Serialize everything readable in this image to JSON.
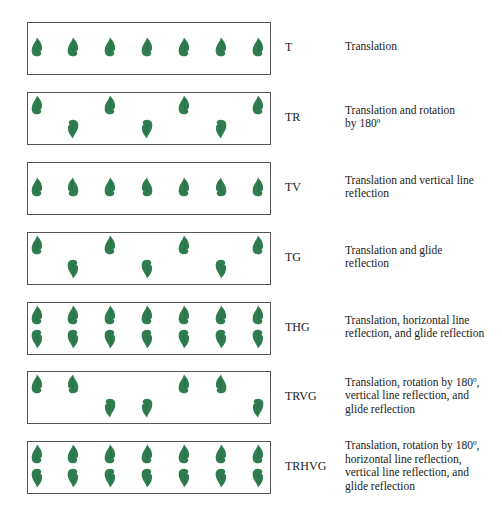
{
  "colors": {
    "leaf": "#2f7d4f",
    "leaf_dark": "#1f5f3a",
    "border": "#555555"
  },
  "leaf_x": [
    37,
    73,
    110,
    147,
    184,
    221,
    258
  ],
  "patterns": [
    {
      "code": "T",
      "description": [
        "Translation"
      ],
      "top": 22,
      "leaves": [
        {
          "col": 0,
          "row": "mid",
          "orient": "up"
        },
        {
          "col": 1,
          "row": "mid",
          "orient": "up"
        },
        {
          "col": 2,
          "row": "mid",
          "orient": "up"
        },
        {
          "col": 3,
          "row": "mid",
          "orient": "up"
        },
        {
          "col": 4,
          "row": "mid",
          "orient": "up"
        },
        {
          "col": 5,
          "row": "mid",
          "orient": "up"
        },
        {
          "col": 6,
          "row": "mid",
          "orient": "up"
        }
      ]
    },
    {
      "code": "TR",
      "description": [
        "Translation and rotation",
        "by 180º"
      ],
      "top": 92,
      "leaves": [
        {
          "col": 0,
          "row": "top",
          "orient": "up"
        },
        {
          "col": 1,
          "row": "bottom",
          "orient": "rot180"
        },
        {
          "col": 2,
          "row": "top",
          "orient": "up"
        },
        {
          "col": 3,
          "row": "bottom",
          "orient": "rot180"
        },
        {
          "col": 4,
          "row": "top",
          "orient": "up"
        },
        {
          "col": 5,
          "row": "bottom",
          "orient": "rot180"
        },
        {
          "col": 6,
          "row": "top",
          "orient": "up"
        }
      ]
    },
    {
      "code": "TV",
      "description": [
        "Translation and vertical line",
        "reflection"
      ],
      "top": 162,
      "leaves": [
        {
          "col": 0,
          "row": "mid",
          "orient": "up"
        },
        {
          "col": 1,
          "row": "mid",
          "orient": "mirror"
        },
        {
          "col": 2,
          "row": "mid",
          "orient": "up"
        },
        {
          "col": 3,
          "row": "mid",
          "orient": "mirror"
        },
        {
          "col": 4,
          "row": "mid",
          "orient": "up"
        },
        {
          "col": 5,
          "row": "mid",
          "orient": "mirror"
        },
        {
          "col": 6,
          "row": "mid",
          "orient": "up"
        }
      ]
    },
    {
      "code": "TG",
      "description": [
        "Translation and glide",
        "reflection"
      ],
      "top": 232,
      "leaves": [
        {
          "col": 0,
          "row": "top",
          "orient": "up"
        },
        {
          "col": 1,
          "row": "bottom",
          "orient": "flipv"
        },
        {
          "col": 2,
          "row": "top",
          "orient": "up"
        },
        {
          "col": 3,
          "row": "bottom",
          "orient": "flipv"
        },
        {
          "col": 4,
          "row": "top",
          "orient": "up"
        },
        {
          "col": 5,
          "row": "bottom",
          "orient": "flipv"
        },
        {
          "col": 6,
          "row": "top",
          "orient": "up"
        }
      ]
    },
    {
      "code": "THG",
      "description": [
        "Translation, horizontal line",
        "reflection, and glide reflection"
      ],
      "top": 302,
      "leaves": [
        {
          "col": 0,
          "row": "top",
          "orient": "up"
        },
        {
          "col": 0,
          "row": "bottom",
          "orient": "flipv"
        },
        {
          "col": 1,
          "row": "top",
          "orient": "up"
        },
        {
          "col": 1,
          "row": "bottom",
          "orient": "flipv"
        },
        {
          "col": 2,
          "row": "top",
          "orient": "up"
        },
        {
          "col": 2,
          "row": "bottom",
          "orient": "flipv"
        },
        {
          "col": 3,
          "row": "top",
          "orient": "up"
        },
        {
          "col": 3,
          "row": "bottom",
          "orient": "flipv"
        },
        {
          "col": 4,
          "row": "top",
          "orient": "up"
        },
        {
          "col": 4,
          "row": "bottom",
          "orient": "flipv"
        },
        {
          "col": 5,
          "row": "top",
          "orient": "up"
        },
        {
          "col": 5,
          "row": "bottom",
          "orient": "flipv"
        },
        {
          "col": 6,
          "row": "top",
          "orient": "up"
        },
        {
          "col": 6,
          "row": "bottom",
          "orient": "flipv"
        }
      ]
    },
    {
      "code": "TRVG",
      "description": [
        "Translation, rotation by 180º,",
        "vertical line reflection, and",
        "glide reflection"
      ],
      "top": 371,
      "leaves": [
        {
          "col": 0,
          "row": "top",
          "orient": "up"
        },
        {
          "col": 1,
          "row": "top",
          "orient": "mirror"
        },
        {
          "col": 2,
          "row": "bottom",
          "orient": "rot180"
        },
        {
          "col": 3,
          "row": "bottom",
          "orient": "flipv_mirror"
        },
        {
          "col": 4,
          "row": "top",
          "orient": "up"
        },
        {
          "col": 5,
          "row": "top",
          "orient": "mirror"
        },
        {
          "col": 6,
          "row": "bottom",
          "orient": "rot180"
        }
      ]
    },
    {
      "code": "TRHVG",
      "description": [
        "Translation, rotation by 180º,",
        "horizontal line reflection,",
        "vertical line reflection, and",
        "glide reflection"
      ],
      "top": 441,
      "leaves": [
        {
          "col": 0,
          "row": "top",
          "orient": "up"
        },
        {
          "col": 0,
          "row": "bottom",
          "orient": "flipv"
        },
        {
          "col": 1,
          "row": "top",
          "orient": "up"
        },
        {
          "col": 1,
          "row": "bottom",
          "orient": "flipv"
        },
        {
          "col": 2,
          "row": "top",
          "orient": "up"
        },
        {
          "col": 2,
          "row": "bottom",
          "orient": "flipv"
        },
        {
          "col": 3,
          "row": "top",
          "orient": "up"
        },
        {
          "col": 3,
          "row": "bottom",
          "orient": "flipv"
        },
        {
          "col": 4,
          "row": "top",
          "orient": "up"
        },
        {
          "col": 4,
          "row": "bottom",
          "orient": "flipv"
        },
        {
          "col": 5,
          "row": "top",
          "orient": "up"
        },
        {
          "col": 5,
          "row": "bottom",
          "orient": "flipv"
        },
        {
          "col": 6,
          "row": "top",
          "orient": "up"
        },
        {
          "col": 6,
          "row": "bottom",
          "orient": "flipv"
        }
      ]
    }
  ]
}
